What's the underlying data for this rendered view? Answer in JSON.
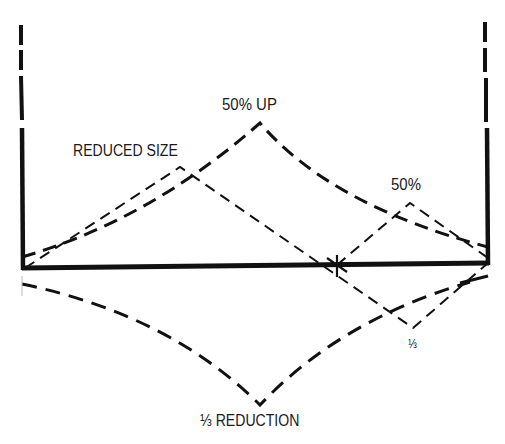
{
  "diagram": {
    "labels": {
      "fifty_up": "50% UP",
      "reduced_size": "REDUCED SIZE",
      "fifty": "50%",
      "third": "⅓",
      "third_reduction": "⅓ REDUCTION"
    },
    "colors": {
      "stroke": "#111111",
      "background": "#ffffff"
    },
    "elements": {
      "left_wall": {
        "x": 22,
        "dashed_top": 25,
        "solid_from": 128,
        "bottom": 268
      },
      "right_wall": {
        "x": 488,
        "dashed_top": 20,
        "solid_from": 128,
        "bottom": 263
      },
      "baseline": {
        "from": [
          22,
          268
        ],
        "to": [
          488,
          263
        ]
      },
      "cross_mark": [
        337,
        265
      ],
      "curve_50_up": {
        "start": [
          22,
          258
        ],
        "peak": [
          260,
          123
        ],
        "end": [
          488,
          248
        ]
      },
      "line_reduced_size": {
        "start": [
          24,
          268
        ],
        "peak": [
          180,
          167
        ],
        "end": [
          413,
          328
        ]
      },
      "line_50": {
        "start": [
          337,
          265
        ],
        "peak": [
          410,
          203
        ],
        "end": [
          488,
          258
        ]
      },
      "line_third": {
        "valley": [
          413,
          328
        ],
        "end": [
          488,
          265
        ]
      },
      "curve_third_reduction": {
        "start": [
          22,
          284
        ],
        "valley": [
          260,
          405
        ],
        "end": [
          488,
          276
        ]
      }
    }
  }
}
